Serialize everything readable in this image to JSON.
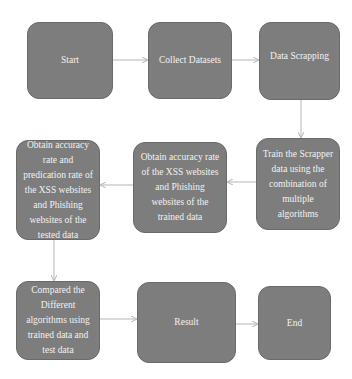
{
  "diagram": {
    "type": "flowchart",
    "colors": {
      "node_fill": "#7d7d7d",
      "node_text": "#f2f2f2",
      "edge": "#b5b5b5",
      "background": "#ffffff"
    },
    "nodes": [
      {
        "id": "start",
        "label": "Start"
      },
      {
        "id": "collect",
        "label": "Collect Datasets"
      },
      {
        "id": "scrapping",
        "label": "Data Scrapping"
      },
      {
        "id": "train",
        "label": "Train the Scrapper data using the combination of multiple algorithms"
      },
      {
        "id": "trained_acc",
        "label": "Obtain accuracy rate of the XSS websites and Phishing websites of the trained data"
      },
      {
        "id": "tested_acc",
        "label": "Obtain accuracy rate and predication rate of the XSS websites and Phishing websites of the tested data"
      },
      {
        "id": "compare",
        "label": "Compared the Different algorithms using trained data and test data"
      },
      {
        "id": "result",
        "label": "Result"
      },
      {
        "id": "end",
        "label": "End"
      }
    ],
    "edges": [
      {
        "from": "start",
        "to": "collect"
      },
      {
        "from": "collect",
        "to": "scrapping"
      },
      {
        "from": "scrapping",
        "to": "train"
      },
      {
        "from": "train",
        "to": "trained_acc"
      },
      {
        "from": "trained_acc",
        "to": "tested_acc"
      },
      {
        "from": "tested_acc",
        "to": "compare"
      },
      {
        "from": "compare",
        "to": "result"
      },
      {
        "from": "result",
        "to": "end"
      }
    ]
  }
}
